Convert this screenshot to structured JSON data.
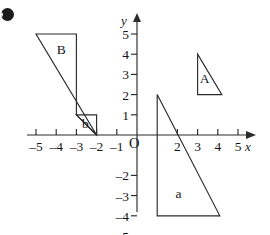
{
  "figure": {
    "bullet": "b-bullet",
    "axes": {
      "x_label": "x",
      "y_label": "y",
      "origin_label": "O",
      "x_ticks": [
        {
          "value": -5,
          "label": "–5"
        },
        {
          "value": -4,
          "label": "–4"
        },
        {
          "value": -3,
          "label": "–3"
        },
        {
          "value": -2,
          "label": "–2"
        },
        {
          "value": -1,
          "label": "–1"
        },
        {
          "value": 2,
          "label": "2"
        },
        {
          "value": 3,
          "label": "3"
        },
        {
          "value": 4,
          "label": "4"
        },
        {
          "value": 5,
          "label": "5"
        }
      ],
      "y_ticks": [
        {
          "value": 5,
          "label": "5"
        },
        {
          "value": 4,
          "label": "4"
        },
        {
          "value": 3,
          "label": "3"
        },
        {
          "value": 2,
          "label": "2"
        },
        {
          "value": 1,
          "label": "1"
        },
        {
          "value": -2,
          "label": "–2"
        },
        {
          "value": -3,
          "label": "–3"
        },
        {
          "value": -4,
          "label": "–4"
        },
        {
          "value": -5,
          "label": "–5"
        }
      ],
      "x_range": [
        -5.6,
        6.3
      ],
      "y_range": [
        -5.6,
        6.2
      ],
      "grid": false
    },
    "shapes": [
      {
        "name": "triangle-A",
        "label": "A",
        "label_point": [
          3.35,
          2.55
        ],
        "points": [
          [
            3,
            4
          ],
          [
            3,
            2
          ],
          [
            4.2,
            2
          ]
        ]
      },
      {
        "name": "triangle-a",
        "label": "a",
        "label_point": [
          2.05,
          -3.1
        ],
        "points": [
          [
            1,
            2
          ],
          [
            1,
            -4
          ],
          [
            4.1,
            -4
          ]
        ]
      },
      {
        "name": "triangle-B",
        "label": "B",
        "label_point": [
          -3.75,
          4.0
        ],
        "points": [
          [
            -5,
            5
          ],
          [
            -3,
            5
          ],
          [
            -3,
            1
          ],
          [
            -2,
            0
          ]
        ]
      },
      {
        "name": "triangle-b",
        "label": "b",
        "label_point": [
          -2.55,
          0.35
        ],
        "points": [
          [
            -3,
            1
          ],
          [
            -2,
            1
          ],
          [
            -2,
            0
          ],
          [
            -3,
            1
          ]
        ]
      }
    ]
  },
  "chart_data": {
    "type": "scatter",
    "title": "",
    "xlabel": "x",
    "ylabel": "y",
    "xlim": [
      -5.6,
      6.3
    ],
    "ylim": [
      -5.6,
      6.2
    ],
    "grid": false,
    "x_tick_labels": [
      "–5",
      "–4",
      "–3",
      "–2",
      "–1",
      "2",
      "3",
      "4",
      "5"
    ],
    "x_tick_values": [
      -5,
      -4,
      -3,
      -2,
      -1,
      2,
      3,
      4,
      5
    ],
    "y_tick_labels": [
      "5",
      "4",
      "3",
      "2",
      "1",
      "–2",
      "–3",
      "–4",
      "–5"
    ],
    "y_tick_values": [
      5,
      4,
      3,
      2,
      1,
      -2,
      -3,
      -4,
      -5
    ],
    "annotations": [
      "A",
      "a",
      "B",
      "b",
      "O",
      "x",
      "y"
    ],
    "series": [
      {
        "name": "A",
        "values": [
          [
            3,
            4
          ],
          [
            3,
            2
          ],
          [
            4.2,
            2
          ]
        ]
      },
      {
        "name": "a",
        "values": [
          [
            1,
            2
          ],
          [
            1,
            -4
          ],
          [
            4.1,
            -4
          ]
        ]
      },
      {
        "name": "B",
        "values": [
          [
            -5,
            5
          ],
          [
            -3,
            5
          ],
          [
            -3,
            1
          ],
          [
            -2,
            0
          ]
        ]
      },
      {
        "name": "b",
        "values": [
          [
            -3,
            1
          ],
          [
            -2,
            1
          ],
          [
            -2,
            0
          ]
        ]
      }
    ]
  }
}
